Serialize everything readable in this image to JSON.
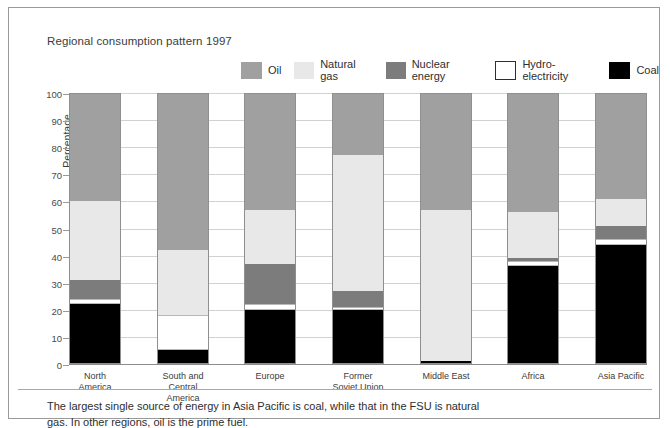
{
  "chart_data": {
    "type": "bar",
    "subtype": "stacked-100-percent",
    "title": "Regional consumption pattern 1997",
    "xlabel": "",
    "ylabel": "Percentage",
    "ylim": [
      0,
      100
    ],
    "yticks": [
      0,
      10,
      20,
      30,
      40,
      50,
      60,
      70,
      80,
      90,
      100
    ],
    "grid": true,
    "legend_position": "top",
    "categories": [
      "North America",
      "South and Central America",
      "Europe",
      "Former Soviet Union",
      "Middle East",
      "Africa",
      "Asia Pacific"
    ],
    "series": [
      {
        "name": "Coal",
        "color": "#000000",
        "values": [
          22,
          5,
          20,
          20,
          1,
          36,
          44
        ]
      },
      {
        "name": "Hydro-electricity",
        "color": "#ffffff",
        "values": [
          2,
          13,
          2,
          1,
          0,
          2,
          2
        ]
      },
      {
        "name": "Nuclear energy",
        "color": "#7c7c7c",
        "values": [
          7,
          0,
          15,
          6,
          0,
          1,
          5
        ]
      },
      {
        "name": "Natural gas",
        "color": "#e8e8e8",
        "values": [
          29,
          24,
          20,
          50,
          56,
          17,
          10
        ]
      },
      {
        "name": "Oil",
        "color": "#a0a0a0",
        "values": [
          40,
          58,
          43,
          23,
          43,
          44,
          39
        ]
      }
    ],
    "caption": "The largest single source of energy in Asia Pacific is coal, while that in the FSU is natural gas. In other regions, oil is the prime fuel."
  },
  "legend": {
    "items": [
      {
        "label": "Oil",
        "color": "#a0a0a0",
        "border": "none"
      },
      {
        "label": "Natural gas",
        "color": "#e8e8e8",
        "border": "none"
      },
      {
        "label": "Nuclear energy",
        "color": "#7c7c7c",
        "border": "none"
      },
      {
        "label": "Hydro-electricity",
        "color": "#ffffff",
        "border": "1px solid #2e2e2e"
      },
      {
        "label": "Coal",
        "color": "#000000",
        "border": "none"
      }
    ]
  }
}
